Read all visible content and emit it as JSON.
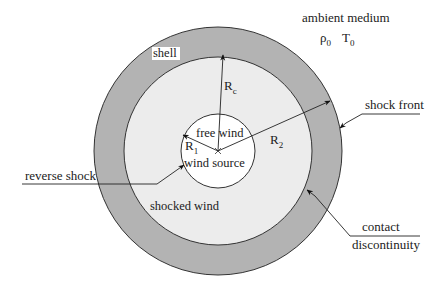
{
  "diagram": {
    "colors": {
      "background": "#ffffff",
      "shell_fill": "#b3b3b3",
      "shocked_wind_fill": "#ececec",
      "free_wind_fill": "#ffffff",
      "stroke": "#333333",
      "text": "#222222"
    },
    "geometry": {
      "center": [
        218,
        151
      ],
      "outer_radius": 124,
      "contact_radius": 94,
      "inner_radius": 37
    },
    "regions": {
      "ambient": "ambient medium",
      "shell": "shell",
      "shocked_wind": "shocked wind",
      "free_wind": "free wind",
      "wind_source": "wind source"
    },
    "ambient_params": {
      "rho": "ρ",
      "rho_sub": "0",
      "T": "T",
      "T_sub": "0"
    },
    "radii": {
      "R1": {
        "main": "R",
        "sub": "1"
      },
      "Rc": {
        "main": "R",
        "sub": "c"
      },
      "R2": {
        "main": "R",
        "sub": "2"
      }
    },
    "annotations": {
      "shock_front": "shock front",
      "reverse_shock": "reverse shock",
      "contact_line1": "contact",
      "contact_line2": "discontinuity"
    }
  }
}
